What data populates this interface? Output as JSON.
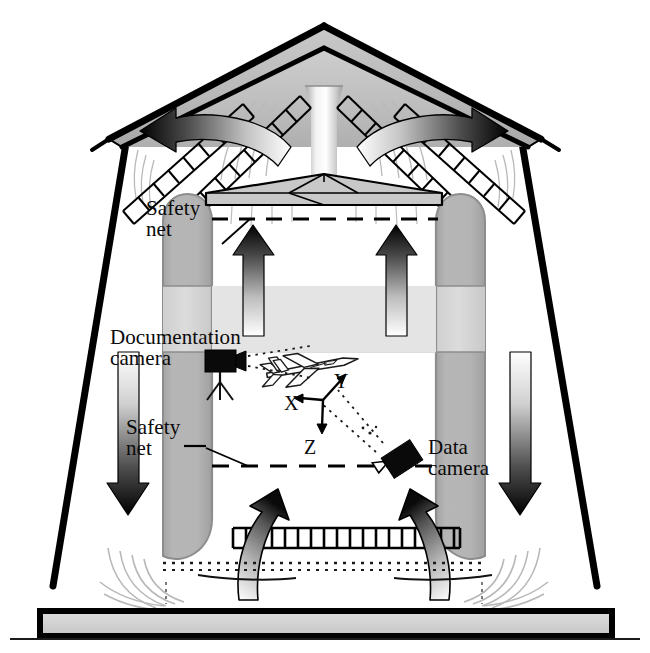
{
  "figure": {
    "background_color": "#ffffff",
    "outline_color": "#000000"
  },
  "labels": {
    "safety_net_upper": "Safety\nnet",
    "safety_net_lower": "Safety\nnet",
    "documentation_camera": "Documentation\ncamera",
    "data_camera": "Data\ncamera"
  },
  "axes": {
    "x": "X",
    "y": "Y",
    "z": "Z"
  },
  "colors": {
    "outline": "#000000",
    "roof_fill_light": "#d6d6d6",
    "roof_fill_dark": "#9a9a9a",
    "column_gray": "#b2b2b2",
    "column_light_gray": "#d8d8d8",
    "plate_gray": "#c6c6c6",
    "base_gray": "#cfcfcf",
    "arrow_dark": "#111111",
    "flow_line": "#b5b5b5",
    "camera_black": "#080808",
    "aircraft_fill": "#fdfdfd"
  },
  "elements": {
    "roof": "roof-gable",
    "center_duct": "center-duct",
    "diffuser_plate": "diffuser-plate",
    "left_column": "left-flow-column",
    "right_column": "right-flow-column",
    "upper_net_dashed": "upper-safety-net-dashed-line",
    "lower_net_dashed": "lower-safety-net-dashed-line",
    "bottom_grate": "bottom-grate",
    "base_slab": "base-slab",
    "aircraft_model": "aircraft-model",
    "doc_camera_icon": "documentation-camera-icon",
    "data_camera_icon": "data-camera-icon",
    "upflow_arrows": "upflow-arrows",
    "downflow_arrows": "downflow-arrows",
    "return_arrows": "return-flow-arrows",
    "net_ladders": "diagonal-net-ladders"
  },
  "counts": {
    "upflow_arrows_center": 2,
    "upflow_arrows_bottom": 2,
    "downflow_arrows": 2,
    "return_arrows": 2,
    "diagonal_nets": 4,
    "cameras": 2,
    "axis_labels": 3
  }
}
